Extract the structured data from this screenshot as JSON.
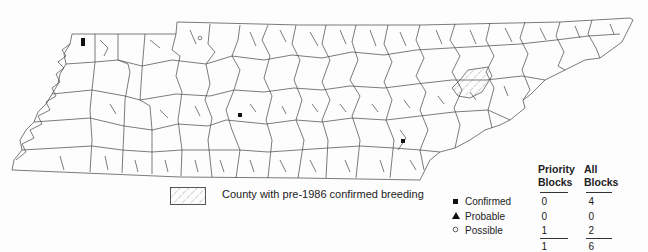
{
  "map": {
    "region": "Tennessee counties",
    "hatched_county_description": "County with pre-1986 confirmed breeding",
    "markers": [
      {
        "type": "confirmed",
        "symbol": "filled-square",
        "x": 83,
        "y": 42
      },
      {
        "type": "possible",
        "symbol": "open-circle",
        "x": 200,
        "y": 38
      },
      {
        "type": "confirmed",
        "symbol": "filled-square",
        "x": 240,
        "y": 115
      },
      {
        "type": "confirmed",
        "symbol": "filled-square",
        "x": 403,
        "y": 141
      }
    ]
  },
  "legend": {
    "hatch_label": "County with pre-1986 confirmed breeding"
  },
  "table": {
    "columns": [
      {
        "line1": "Priority",
        "line2": "Blocks"
      },
      {
        "line1": "All",
        "line2": "Blocks"
      }
    ],
    "rows": [
      {
        "symbol": "filled-square",
        "label": "Confirmed",
        "priority": "0",
        "all": "4"
      },
      {
        "symbol": "filled-triangle",
        "label": "Probable",
        "priority": "0",
        "all": "0"
      },
      {
        "symbol": "open-circle",
        "label": "Possible",
        "priority": "1",
        "all": "2"
      }
    ],
    "totals": {
      "priority": "1",
      "all": "6"
    }
  }
}
